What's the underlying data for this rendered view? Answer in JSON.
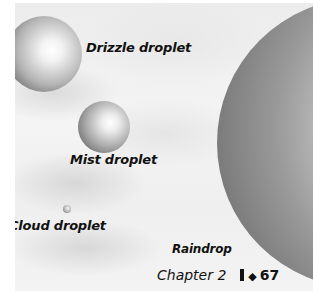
{
  "figure": {
    "droplets": [
      {
        "name": "drizzle",
        "label": "Drizzle droplet"
      },
      {
        "name": "mist",
        "label": "Mist droplet"
      },
      {
        "name": "cloud",
        "label": "Cloud droplet"
      },
      {
        "name": "rain",
        "label": "Raindrop"
      }
    ]
  },
  "footer": {
    "chapter": "Chapter 2",
    "separator_icon": "◆",
    "page_number": "67"
  }
}
